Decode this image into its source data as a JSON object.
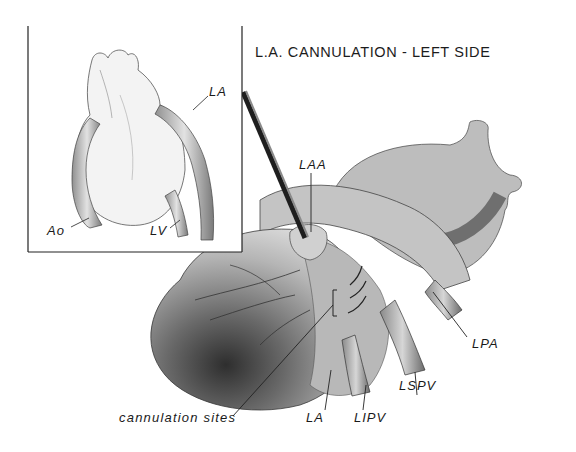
{
  "figure": {
    "title": "L.A. CANNULATION - LEFT SIDE",
    "inset": {
      "labels": {
        "la": "LA",
        "ao": "Ao",
        "lv": "LV"
      }
    },
    "main": {
      "labels": {
        "laa": "LAA",
        "lpa": "LPA",
        "lspv": "LSPV",
        "lipv": "LIPV",
        "la": "LA",
        "cannulation_sites": "cannulation sites"
      }
    },
    "colors": {
      "ink": "#1a1a1a",
      "tissue_light": "#d9d9d9",
      "tissue_mid": "#a8a8a8",
      "tissue_dark": "#4a4a4a",
      "background": "#ffffff"
    }
  }
}
